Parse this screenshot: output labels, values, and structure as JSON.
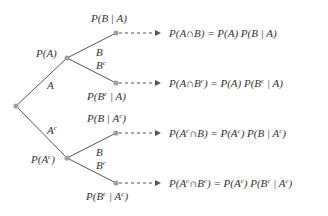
{
  "colors": {
    "line": "#555555",
    "node": "#a0a0a0",
    "text": "#333333",
    "arrow": "#555555"
  },
  "nodes": {
    "root": {
      "x": 16,
      "y": 106
    },
    "A": {
      "x": 67,
      "y": 58,
      "prob_label": "P(A)",
      "edge_label": "A"
    },
    "Ac": {
      "x": 67,
      "y": 158,
      "prob_label": "P(Aᶜ)",
      "edge_label": "Aᶜ"
    },
    "A_B": {
      "x": 116,
      "y": 33,
      "prob_label": "P(B | A)",
      "edge_label": "B"
    },
    "A_Bc": {
      "x": 116,
      "y": 83,
      "prob_label": "P(Bᶜ | A)",
      "edge_label": "Bᶜ"
    },
    "Ac_B": {
      "x": 116,
      "y": 133,
      "prob_label": "P(B | Aᶜ)",
      "edge_label": "B"
    },
    "Ac_Bc": {
      "x": 116,
      "y": 183,
      "prob_label": "P(Bᶜ | Aᶜ)",
      "edge_label": "Bᶜ"
    }
  },
  "results": [
    {
      "lhs": "P(A ∩ B)",
      "rhs": "P(A) P(B | A)"
    },
    {
      "lhs": "P(A ∩ Bᶜ)",
      "rhs": "P(A) P(Bᶜ | A)"
    },
    {
      "lhs": "P(Aᶜ ∩ B)",
      "rhs": "P(Aᶜ) P(B | Aᶜ)"
    },
    {
      "lhs": "P(Aᶜ ∩ Bᶜ)",
      "rhs": "P(Aᶜ) P(Bᶜ | Aᶜ)"
    }
  ],
  "text": {
    "pA": "P(A)",
    "pAc_pre": "P(A",
    "pAc_post": ")",
    "edgeA": "A",
    "edgeAc": "A",
    "c": "c",
    "B": "B",
    "pBA": "P(B | A)",
    "pBcA_pre": "P(B",
    "pBcA_post": " | A)",
    "pBAc_pre": "P(B | A",
    "pBAc_post": ")",
    "pBcAc_pre": "P(B",
    "pBcAc_mid": " | A",
    "pBcAc_post": ")",
    "r1": "P(A∩B) = P(A) P(B | A)",
    "r2_a": "P(A∩B",
    "r2_b": ") = P(A) P(B",
    "r2_c": " | A)",
    "r3_a": "P(A",
    "r3_b": "∩B) = P(A",
    "r3_c": ") P(B | A",
    "r3_d": ")",
    "r4_a": "P(A",
    "r4_b": "∩B",
    "r4_c": ") = P(A",
    "r4_d": ") P(B",
    "r4_e": " | A",
    "r4_f": ")"
  }
}
